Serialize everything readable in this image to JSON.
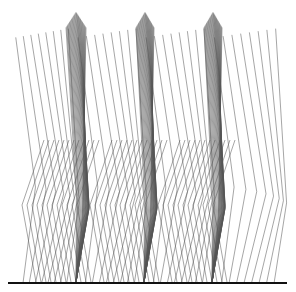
{
  "figure": {
    "width": 296,
    "height": 292,
    "background": "#ffffff",
    "line_color": "#555555",
    "line_opacity": 0.75,
    "line_width": 0.7,
    "ground_color": "#111111",
    "ground_width": 2.2
  },
  "ground": {
    "y": 283,
    "x_start": 8,
    "x_end": 287
  },
  "gait": {
    "description": "Stick-diagram of leg segments (hip-knee-ankle) over three stance phases",
    "hip_y_range": [
      12,
      34
    ],
    "knee_y_range": [
      196,
      216
    ],
    "strides": [
      {
        "stance_foot_x": 76,
        "hip_x_start": 66,
        "hip_x_end": 86,
        "knee_apex_x": 92,
        "frames": 30
      },
      {
        "stance_foot_x": 144,
        "hip_x_start": 136,
        "hip_x_end": 154,
        "knee_apex_x": 160,
        "frames": 30
      },
      {
        "stance_foot_x": 212,
        "hip_x_start": 204,
        "hip_x_end": 222,
        "knee_apex_x": 228,
        "frames": 30
      }
    ],
    "swing_frames_before": 10,
    "swing_frames_after": 12,
    "swing_x_start": 20,
    "swing_x_end": 278
  }
}
